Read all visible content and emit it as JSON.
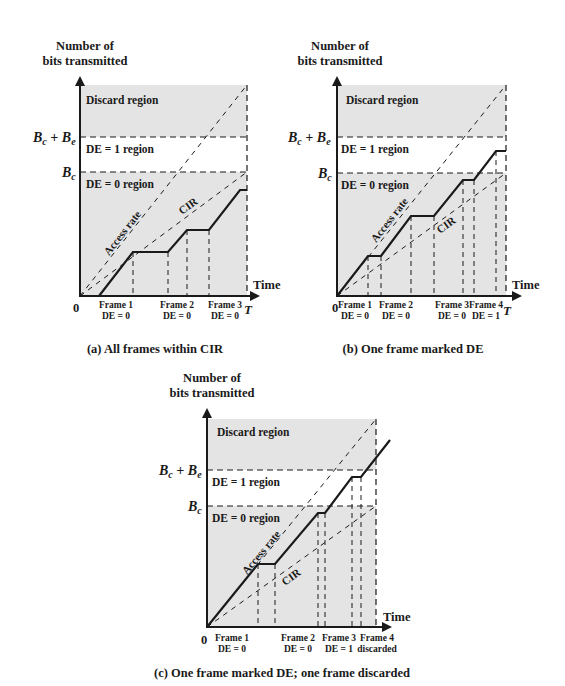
{
  "colors": {
    "shade": "#e4e4e4",
    "ink": "#1a1a1a",
    "background": "#ffffff"
  },
  "common": {
    "ylabel_line1": "Number of",
    "ylabel_line2": "bits transmitted",
    "xlabel": "Time",
    "origin": "0",
    "T": "T",
    "bcbe": "B",
    "bcbe_sub1": "c",
    "bcbe_plus": " + B",
    "bcbe_sub2": "e",
    "bc": "B",
    "bc_sub": "c",
    "discard_region": "Discard region",
    "de1_region": "DE = 1 region",
    "de0_region": "DE = 0 region",
    "access_rate": "Access rate",
    "cir": "CIR"
  },
  "panels": [
    {
      "id": "a",
      "caption": "(a) All frames within CIR",
      "frames": [
        {
          "name": "Frame 1",
          "status": "DE = 0"
        },
        {
          "name": "Frame 2",
          "status": "DE = 0"
        },
        {
          "name": "Frame 3",
          "status": "DE = 0"
        }
      ]
    },
    {
      "id": "b",
      "caption": "(b) One frame marked DE",
      "frames": [
        {
          "name": "Frame 1",
          "status": "DE = 0"
        },
        {
          "name": "Frame 2",
          "status": "DE = 0"
        },
        {
          "name": "Frame 3",
          "status": "DE = 0"
        },
        {
          "name": "Frame 4",
          "status": "DE = 1"
        }
      ]
    },
    {
      "id": "c",
      "caption": "(c) One frame marked DE; one frame discarded",
      "frames": [
        {
          "name": "Frame 1",
          "status": "DE = 0"
        },
        {
          "name": "Frame 2",
          "status": "DE = 0"
        },
        {
          "name": "Frame 3",
          "status": "DE = 1"
        },
        {
          "name": "Frame 4",
          "status": "discarded"
        }
      ]
    }
  ]
}
